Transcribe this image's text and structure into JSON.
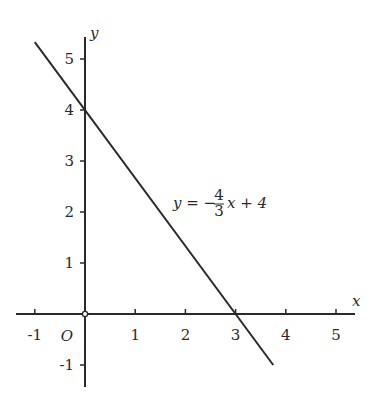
{
  "chart_data": {
    "type": "line",
    "title": "",
    "xlabel": "x",
    "ylabel": "y",
    "origin_label": "O",
    "xlim": [
      -1.3,
      5.4
    ],
    "ylim": [
      -1.4,
      5.5
    ],
    "grid": false,
    "x_ticks": [
      -1,
      1,
      2,
      3,
      4,
      5
    ],
    "x_tick_labels": [
      "-1",
      "1",
      "2",
      "3",
      "4",
      "5"
    ],
    "y_ticks": [
      -1,
      1,
      2,
      3,
      4,
      5
    ],
    "y_tick_labels": [
      "-1",
      "1",
      "2",
      "3",
      "4",
      "5"
    ],
    "series": [
      {
        "name": "y = -4/3 x + 4",
        "slope": -1.3333,
        "intercept": 4,
        "x": [
          -1.0,
          0,
          3,
          3.75
        ],
        "y": [
          5.33,
          4,
          0,
          -1.0
        ]
      }
    ],
    "annotations": [
      {
        "text_parts": {
          "lhs": "y = −",
          "num": "4",
          "den": "3",
          "rhs": "x + 4"
        },
        "x": 1.8,
        "y": 2.1
      }
    ]
  }
}
